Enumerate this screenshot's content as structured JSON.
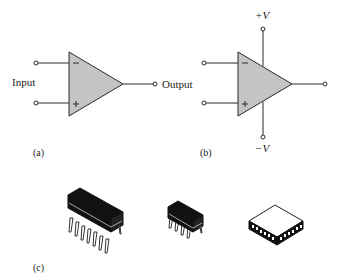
{
  "figure": {
    "panels": [
      {
        "id": "a",
        "caption": "(a)",
        "description": "Op-amp schematic symbol",
        "labels": {
          "input": "Input",
          "output": "Output",
          "inverting": "−",
          "non_inverting": "+"
        }
      },
      {
        "id": "b",
        "caption": "(b)",
        "description": "Op-amp symbol with DC supply voltages",
        "labels": {
          "inverting": "−",
          "non_inverting": "+",
          "positive_supply": "+V",
          "negative_supply": "−V"
        }
      },
      {
        "id": "c",
        "caption": "(c)",
        "description": "Typical IC packages",
        "packages": [
          "14-pin DIP",
          "8-pin DIP",
          "Surface-mount chip carrier"
        ]
      }
    ],
    "colors": {
      "triangle_fill": "#c4c4c4",
      "stroke": "#2a2a2a",
      "chip_body": "#111111"
    }
  }
}
